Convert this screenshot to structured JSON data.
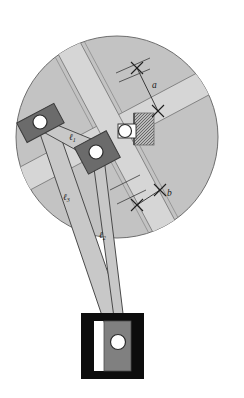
{
  "figure": {
    "kind": "mechanical-linkage-diagram"
  },
  "labels": {
    "link1": "ℓ",
    "link1_sub": "1",
    "link2": "ℓ",
    "link2_sub": "2",
    "link3": "ℓ",
    "link3_sub": "3",
    "dim_a": "a",
    "dim_b": "b"
  },
  "colors": {
    "disc_fill": "#c3c3c3",
    "disc_stroke": "#6e6e6e",
    "slot_fill": "#d6d6d6",
    "slot_stroke": "#7a7a7a",
    "link_fill": "#c8c8c8",
    "link_stroke": "#4a4a4a",
    "slider_fill": "#6b6b6b",
    "slider_stroke": "#3a3a3a",
    "pin_fill": "#ffffff",
    "pin_stroke": "#2b2b2b",
    "fixture_black": "#0d0d0d",
    "fixture_gray": "#808080",
    "hatch_fill": "#9a9a9a",
    "label_color": "#1a1a1a",
    "background": "#ffffff"
  },
  "geometry": {
    "disc": {
      "cx": 117,
      "cy": 137,
      "r": 101
    },
    "pins": [
      {
        "name": "left-joint-pin",
        "x": 40,
        "y": 122,
        "r": 7
      },
      {
        "name": "middle-joint-pin",
        "x": 96,
        "y": 152,
        "r": 7
      },
      {
        "name": "center-pivot-pin",
        "x": 125,
        "y": 131,
        "r": 6.5
      },
      {
        "name": "bottom-pin",
        "x": 121,
        "y": 342,
        "r": 7
      }
    ],
    "dimension_a": {
      "from": [
        137,
        68
      ],
      "to": [
        158,
        111
      ],
      "label_pos": [
        155,
        85
      ]
    },
    "dimension_b": {
      "from": [
        138,
        202
      ],
      "to": [
        160,
        190
      ],
      "label_pos": [
        167,
        194
      ]
    }
  },
  "parts": [
    {
      "name": "rotating-slotted-disc",
      "description": "large gray disc with cross-shaped slots"
    },
    {
      "name": "slot-channel-vertical",
      "description": "light gray slot running upper-left to lower-right"
    },
    {
      "name": "slot-channel-horizontal",
      "description": "light gray slot running across the disc"
    },
    {
      "name": "slider-block-left",
      "description": "dark gray slider block at left joint"
    },
    {
      "name": "slider-block-middle",
      "description": "dark gray slider block at middle joint"
    },
    {
      "name": "link-l1",
      "description": "link between left joint and middle joint"
    },
    {
      "name": "link-l2",
      "description": "link from middle joint down to bottom pin"
    },
    {
      "name": "link-l3",
      "description": "long tapering link from left joint down to bottom pin"
    },
    {
      "name": "ground-hatch-block",
      "description": "hatched fixed ground block beside center pivot"
    },
    {
      "name": "bottom-fixture",
      "description": "H-shaped black guide fixture with gray slider"
    }
  ]
}
